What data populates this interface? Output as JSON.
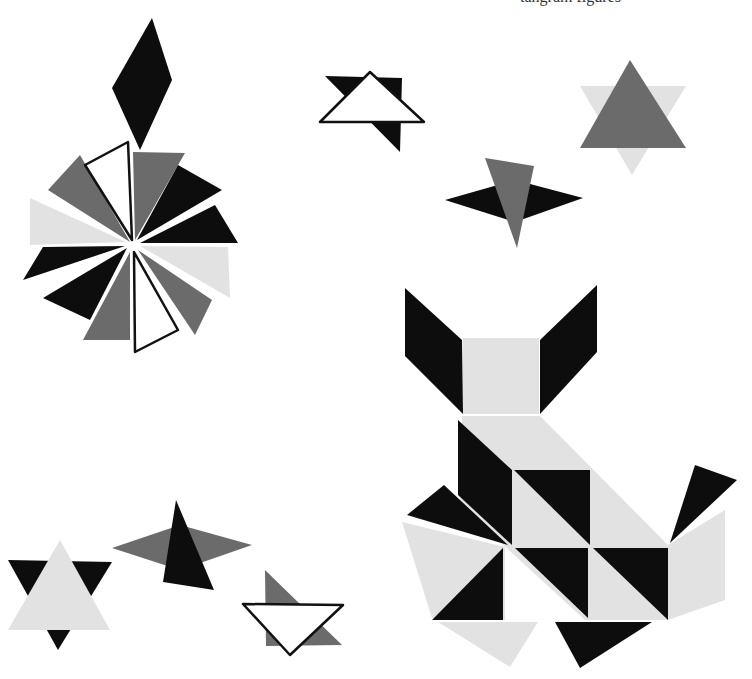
{
  "caption": "tangram figures",
  "palette": {
    "dark": "#0d0d0d",
    "mid": "#6b6b6b",
    "light": "#e2e2e2",
    "outline": "#ffffff"
  },
  "figures": [
    {
      "name": "pinwheel-with-diamond",
      "pieces": 13
    },
    {
      "name": "outlined-triangle-star",
      "pieces": 2
    },
    {
      "name": "grey-six-point-star",
      "pieces": 2
    },
    {
      "name": "black-diamond-grey-triangle",
      "pieces": 2
    },
    {
      "name": "cat",
      "pieces": 16
    },
    {
      "name": "light-star-dark-points",
      "pieces": 2
    },
    {
      "name": "grey-diamond-black-triangle",
      "pieces": 2
    },
    {
      "name": "outlined-inverted-triangle",
      "pieces": 2
    }
  ]
}
